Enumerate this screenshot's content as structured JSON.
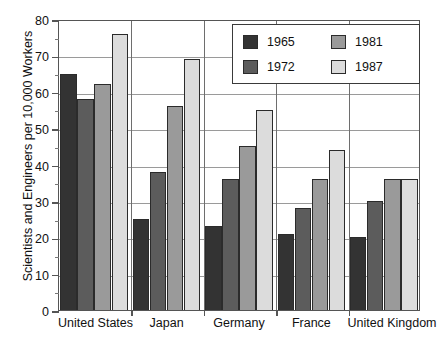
{
  "chart_data": {
    "type": "bar",
    "title": "",
    "xlabel": "",
    "ylabel": "Scientists and Engineers per 10,000 Workers",
    "ylim": [
      0,
      80
    ],
    "ytick_labels": [
      "0",
      "10",
      "20",
      "30",
      "40",
      "50",
      "60",
      "70",
      "80"
    ],
    "ytick_values": [
      0,
      10,
      20,
      30,
      40,
      50,
      60,
      70,
      80
    ],
    "grid": "horizontal-and-group-separators",
    "legend_position": "top-right-inside",
    "categories": [
      "United States",
      "Japan",
      "Germany",
      "France",
      "United Kingdom"
    ],
    "series": [
      {
        "name": "1965",
        "color": "#333333",
        "values": [
          65,
          25,
          23,
          21,
          20
        ]
      },
      {
        "name": "1972",
        "color": "#5c5c5c",
        "values": [
          58,
          38,
          36,
          28,
          30
        ]
      },
      {
        "name": "1981",
        "color": "#9a9a9a",
        "values": [
          62,
          56,
          45,
          36,
          36
        ]
      },
      {
        "name": "1987",
        "color": "#dcdcdc",
        "values": [
          76,
          69,
          55,
          44,
          36
        ]
      }
    ]
  },
  "legend": {
    "entries": [
      {
        "label": "1965"
      },
      {
        "label": "1981"
      },
      {
        "label": "1972"
      },
      {
        "label": "1987"
      }
    ]
  },
  "colors": {
    "axis": "#555555",
    "grid": "#9a9a9a",
    "bar_outline": "#2b2b2b",
    "legend_border": "#3a3a3a",
    "background": "#ffffff"
  }
}
